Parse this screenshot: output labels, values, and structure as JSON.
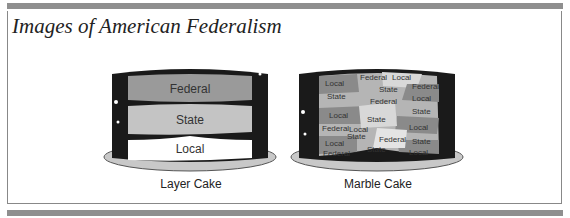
{
  "header": {
    "title": "Images of American Federalism"
  },
  "figures": [
    {
      "caption": "Layer Cake",
      "layers": [
        {
          "label": "Federal",
          "color": "#9a9a9a"
        },
        {
          "label": "State",
          "color": "#c4c4c4"
        },
        {
          "label": "Local",
          "color": "#ffffff"
        }
      ]
    },
    {
      "caption": "Marble Cake",
      "patches": [
        {
          "label": "Local"
        },
        {
          "label": "Federal"
        },
        {
          "label": "Local"
        },
        {
          "label": "State"
        },
        {
          "label": "Federal"
        },
        {
          "label": "State"
        },
        {
          "label": "Federal"
        },
        {
          "label": "Local"
        },
        {
          "label": "Local"
        },
        {
          "label": "State"
        },
        {
          "label": "State"
        },
        {
          "label": "Federal"
        },
        {
          "label": "Local"
        },
        {
          "label": "Local"
        },
        {
          "label": "State"
        },
        {
          "label": "Local"
        },
        {
          "label": "Federal"
        },
        {
          "label": "State"
        },
        {
          "label": "Federal"
        },
        {
          "label": "State"
        },
        {
          "label": "Local"
        }
      ]
    }
  ],
  "colors": {
    "band": "#8f8f8f",
    "frosting": "#1a1a1a",
    "plate": "#c8c8c8"
  }
}
